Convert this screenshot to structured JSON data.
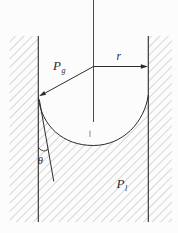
{
  "diagram": {
    "labels": {
      "gas_pressure_base": "P",
      "gas_pressure_sub": "g",
      "radius": "r",
      "contact_angle": "θ",
      "liquid_pressure_base": "P",
      "liquid_pressure_sub": "l"
    },
    "colors": {
      "background": "#fcfcfc",
      "line": "#2b2b2b",
      "hatch": "#8e8e8e",
      "axis": "#4a4a4a",
      "tick": "#8a8a8a"
    }
  }
}
